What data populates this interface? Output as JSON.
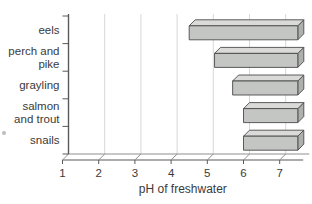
{
  "chart_data": {
    "type": "bar",
    "orientation": "horizontal",
    "style": "3d-extruded-bars",
    "title": "",
    "xlabel": "pH of freshwater",
    "ylabel": "",
    "categories": [
      "eels",
      "perch and\npike",
      "grayling",
      "salmon\nand trout",
      "snails"
    ],
    "series": [
      {
        "name": "pH range tolerated",
        "ranges": [
          {
            "category": "eels",
            "min": 4.5,
            "max": 7.5
          },
          {
            "category": "perch and pike",
            "min": 5.2,
            "max": 7.5
          },
          {
            "category": "grayling",
            "min": 5.7,
            "max": 7.5
          },
          {
            "category": "salmon and trout",
            "min": 6.0,
            "max": 7.5
          },
          {
            "category": "snails",
            "min": 6.0,
            "max": 7.5
          }
        ]
      }
    ],
    "x_ticks": [
      1,
      2,
      3,
      4,
      5,
      6,
      7
    ],
    "xlim": [
      1,
      7.65
    ],
    "grid": true,
    "legend": "none",
    "colors": {
      "bar_front": "#c4c6c3",
      "bar_top": "#dadbd8",
      "bar_side": "#aeb0ad",
      "bar_outline": "#4b4b4b",
      "gridline": "#d7d7d7",
      "axis": "#5a5a5a",
      "floor": "#8f8f8f",
      "text": "#3a3a3a",
      "background": "#ffffff"
    }
  }
}
